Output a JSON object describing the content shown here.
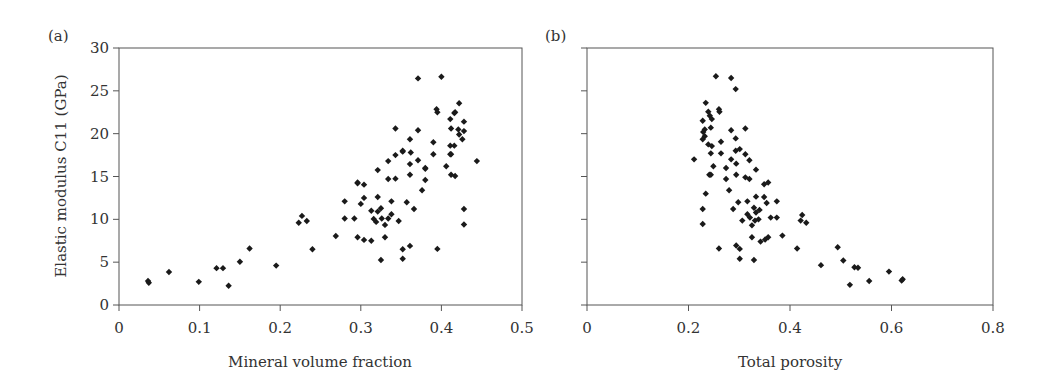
{
  "chart_data": [
    {
      "type": "scatter",
      "panel_label": "(a)",
      "title": "",
      "xlabel": "Mineral volume fraction",
      "ylabel": "Elastic modulus C11 (GPa)",
      "xlim": [
        0,
        0.5
      ],
      "ylim": [
        0,
        30
      ],
      "xticks": [
        0,
        0.1,
        0.2,
        0.3,
        0.4,
        0.5
      ],
      "xtick_labels": [
        "0",
        "0.1",
        "0.2",
        "0.3",
        "0.4",
        "0.5"
      ],
      "yticks": [
        0,
        5,
        10,
        15,
        20,
        25,
        30
      ],
      "ytick_labels": [
        "0",
        "5",
        "10",
        "15",
        "20",
        "25",
        "30"
      ],
      "grid": false,
      "legend": null,
      "marker": "diamond",
      "series": [
        {
          "name": "C11 vs mineral volume fraction",
          "x": [
            0.036,
            0.037,
            0.062,
            0.099,
            0.121,
            0.129,
            0.136,
            0.15,
            0.162,
            0.195,
            0.223,
            0.227,
            0.233,
            0.24,
            0.269,
            0.28,
            0.28,
            0.292,
            0.296,
            0.296,
            0.3,
            0.304,
            0.304,
            0.304,
            0.313,
            0.313,
            0.316,
            0.319,
            0.321,
            0.321,
            0.321,
            0.325,
            0.325,
            0.326,
            0.33,
            0.33,
            0.334,
            0.334,
            0.334,
            0.338,
            0.338,
            0.343,
            0.343,
            0.343,
            0.347,
            0.352,
            0.352,
            0.352,
            0.352,
            0.357,
            0.361,
            0.361,
            0.361,
            0.361,
            0.362,
            0.366,
            0.371,
            0.371,
            0.371,
            0.376,
            0.38,
            0.38,
            0.38,
            0.39,
            0.39,
            0.394,
            0.395,
            0.395,
            0.406,
            0.411,
            0.411,
            0.411,
            0.412,
            0.412,
            0.416,
            0.416,
            0.417,
            0.421,
            0.422,
            0.422,
            0.426,
            0.428,
            0.428,
            0.428,
            0.428,
            0.4,
            0.444,
            0.412,
            0.417,
            0.296
          ],
          "y": [
            2.8,
            2.6,
            3.85,
            2.7,
            4.3,
            4.3,
            2.25,
            5.05,
            6.6,
            4.6,
            9.6,
            10.4,
            9.8,
            6.5,
            8.05,
            12.1,
            10.1,
            10.1,
            14.3,
            7.9,
            11.8,
            14.05,
            12.5,
            7.6,
            11.0,
            7.5,
            10.05,
            9.7,
            15.75,
            12.6,
            10.9,
            11.3,
            5.25,
            10.1,
            9.35,
            7.9,
            16.8,
            14.7,
            10.1,
            12.1,
            10.6,
            17.5,
            14.75,
            20.6,
            9.8,
            17.9,
            6.5,
            5.4,
            18.0,
            12.0,
            19.35,
            16.45,
            15.2,
            6.9,
            17.8,
            11.2,
            26.45,
            20.4,
            16.9,
            13.4,
            16.0,
            14.6,
            15.9,
            19.0,
            17.6,
            22.85,
            22.5,
            6.55,
            16.2,
            21.7,
            18.6,
            17.6,
            20.6,
            15.2,
            22.4,
            18.6,
            15.05,
            20.5,
            23.55,
            19.9,
            19.35,
            21.4,
            20.3,
            11.2,
            9.4,
            26.65,
            16.8,
            17.6,
            22.5,
            14.2
          ]
        }
      ]
    },
    {
      "type": "scatter",
      "panel_label": "(b)",
      "title": "",
      "xlabel": "Total porosity",
      "ylabel": "",
      "xlim": [
        0,
        0.8
      ],
      "ylim": [
        0,
        30
      ],
      "xticks": [
        0,
        0.2,
        0.4,
        0.6,
        0.8
      ],
      "xtick_labels": [
        "0",
        "0.2",
        "0.4",
        "0.6",
        "0.8"
      ],
      "yticks": [
        0,
        5,
        10,
        15,
        20,
        25,
        30
      ],
      "ytick_labels": [],
      "grid": false,
      "legend": null,
      "marker": "diamond",
      "series": [
        {
          "name": "C11 vs total porosity",
          "x": [
            0.254,
            0.284,
            0.293,
            0.234,
            0.239,
            0.26,
            0.261,
            0.242,
            0.246,
            0.228,
            0.244,
            0.232,
            0.229,
            0.284,
            0.312,
            0.232,
            0.228,
            0.293,
            0.239,
            0.246,
            0.264,
            0.293,
            0.301,
            0.312,
            0.244,
            0.264,
            0.211,
            0.284,
            0.294,
            0.32,
            0.249,
            0.274,
            0.333,
            0.241,
            0.244,
            0.274,
            0.294,
            0.312,
            0.32,
            0.349,
            0.357,
            0.234,
            0.28,
            0.228,
            0.228,
            0.298,
            0.316,
            0.333,
            0.349,
            0.354,
            0.374,
            0.288,
            0.329,
            0.34,
            0.333,
            0.316,
            0.321,
            0.306,
            0.331,
            0.338,
            0.362,
            0.374,
            0.325,
            0.424,
            0.421,
            0.432,
            0.325,
            0.342,
            0.351,
            0.357,
            0.385,
            0.26,
            0.294,
            0.301,
            0.414,
            0.301,
            0.329,
            0.461,
            0.494,
            0.505,
            0.527,
            0.534,
            0.518,
            0.556,
            0.595,
            0.62,
            0.622
          ],
          "y": [
            26.7,
            26.5,
            25.2,
            23.6,
            22.55,
            22.85,
            22.55,
            22.1,
            21.7,
            21.5,
            20.7,
            20.5,
            20.2,
            20.4,
            20.6,
            19.7,
            19.35,
            19.45,
            18.75,
            18.55,
            19.05,
            18.0,
            18.2,
            17.6,
            17.7,
            17.7,
            17.0,
            17.0,
            16.5,
            16.9,
            16.2,
            16.0,
            15.8,
            15.2,
            15.2,
            14.7,
            15.2,
            14.9,
            14.7,
            14.1,
            14.3,
            13.0,
            13.4,
            11.2,
            9.45,
            12.0,
            12.1,
            12.65,
            12.6,
            11.9,
            12.1,
            11.2,
            11.35,
            11.1,
            10.8,
            10.6,
            10.2,
            9.85,
            9.85,
            10.0,
            10.2,
            10.2,
            9.3,
            10.5,
            9.85,
            9.6,
            7.9,
            7.4,
            7.65,
            7.9,
            8.1,
            6.6,
            6.95,
            6.55,
            6.6,
            5.4,
            5.25,
            4.65,
            6.75,
            5.2,
            4.4,
            4.35,
            2.35,
            2.8,
            3.9,
            2.85,
            3.0
          ]
        }
      ]
    }
  ],
  "layout": {
    "panels": [
      {
        "left": 119,
        "right": 522,
        "top": 48,
        "bottom": 305
      },
      {
        "left": 587,
        "right": 993,
        "top": 48,
        "bottom": 305
      }
    ],
    "colors": {
      "axis": "#555555",
      "marker": "#1a1a1a",
      "text": "#333333"
    }
  }
}
